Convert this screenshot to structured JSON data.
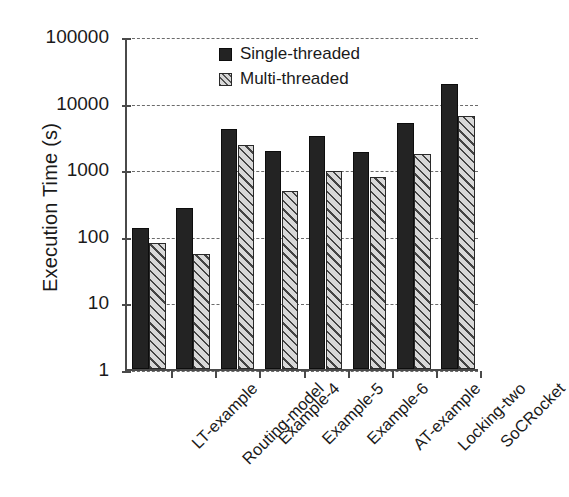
{
  "chart_data": {
    "type": "bar",
    "title": "",
    "xlabel": "",
    "ylabel": "Execution Time (s)",
    "yscale": "log",
    "ylim": [
      1,
      100000
    ],
    "ytick_labels": [
      "100000",
      "10000",
      "1000",
      "100",
      "10",
      "1"
    ],
    "ytick_values": [
      100000,
      10000,
      1000,
      100,
      10,
      1
    ],
    "grid": "horizontal-dashed",
    "legend_position": "top-center",
    "categories": [
      "LT-example",
      "Routing-model",
      "Example-4",
      "Example-5",
      "Example-6",
      "AT-example",
      "Locking-two",
      "SoCRocket"
    ],
    "series": [
      {
        "name": "Single-threaded",
        "color": "#232323",
        "pattern": "solid",
        "values": [
          130,
          260,
          4000,
          1900,
          3200,
          1800,
          4900,
          19000
        ]
      },
      {
        "name": "Multi-threaded",
        "color": "#d8d8d8",
        "pattern": "diagonal-hatch",
        "values": [
          77,
          53,
          2300,
          470,
          950,
          760,
          1700,
          6200
        ]
      }
    ]
  },
  "legend": {
    "items": [
      {
        "label": "Single-threaded",
        "swatch": "solid-black-square-icon"
      },
      {
        "label": "Multi-threaded",
        "swatch": "hatched-square-icon"
      }
    ]
  }
}
